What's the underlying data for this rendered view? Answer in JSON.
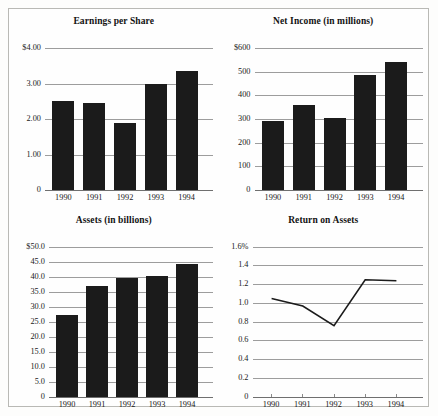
{
  "figure": {
    "background_color": "#fefefe",
    "border_color": "#b9b9b5",
    "bar_color": "#1b1b1b",
    "gridline_color": "#9d9d9d",
    "line_color": "#1b1b1b"
  },
  "charts": [
    {
      "id": "earnings-per-share",
      "chart_data": {
        "type": "bar",
        "title": "Earnings per Share",
        "categories": [
          "1990",
          "1991",
          "1992",
          "1993",
          "1994"
        ],
        "values": [
          2.5,
          2.45,
          1.88,
          2.98,
          3.35
        ],
        "ticks": [
          "$4.00",
          "3.00",
          "2.00",
          "1.00",
          "0"
        ],
        "tick_values": [
          4,
          3,
          2,
          1,
          0
        ],
        "ylim": [
          0,
          4
        ],
        "xlabel": "",
        "ylabel": "",
        "grid": true,
        "legend": "none"
      }
    },
    {
      "id": "net-income",
      "chart_data": {
        "type": "bar",
        "title": "Net Income (in millions)",
        "categories": [
          "1990",
          "1991",
          "1992",
          "1993",
          "1994"
        ],
        "values": [
          290,
          358,
          303,
          487,
          543
        ],
        "ticks": [
          "$600",
          "500",
          "400",
          "300",
          "200",
          "100",
          "0"
        ],
        "tick_values": [
          600,
          500,
          400,
          300,
          200,
          100,
          0
        ],
        "ylim": [
          0,
          600
        ],
        "xlabel": "",
        "ylabel": "",
        "grid": true,
        "legend": "none"
      }
    },
    {
      "id": "assets",
      "chart_data": {
        "type": "bar",
        "title": "Assets (in billions)",
        "categories": [
          "1990",
          "1991",
          "1992",
          "1993",
          "1994"
        ],
        "values": [
          27.2,
          37.0,
          39.5,
          40.2,
          44.2
        ],
        "ticks": [
          "$50.0",
          "45.0",
          "40.0",
          "35.0",
          "30.0",
          "25.0",
          "20.0",
          "15.0",
          "10.0",
          "5.0",
          "0"
        ],
        "tick_values": [
          50,
          45,
          40,
          35,
          30,
          25,
          20,
          15,
          10,
          5,
          0
        ],
        "ylim": [
          0,
          50
        ],
        "xlabel": "",
        "ylabel": "",
        "grid": true,
        "legend": "none"
      }
    },
    {
      "id": "return-on-assets",
      "chart_data": {
        "type": "line",
        "title": "Return on Assets",
        "categories": [
          "1990",
          "1991",
          "1992",
          "1993",
          "1994"
        ],
        "values": [
          1.05,
          0.97,
          0.76,
          1.25,
          1.24
        ],
        "ticks": [
          "1.6%",
          "1.4",
          "1.2",
          "1.0",
          "0.8",
          "0.6",
          "0.4",
          "0.2",
          "0"
        ],
        "tick_values": [
          1.6,
          1.4,
          1.2,
          1.0,
          0.8,
          0.6,
          0.4,
          0.2,
          0
        ],
        "ylim": [
          0,
          1.6
        ],
        "xlabel": "",
        "ylabel": "",
        "grid": true,
        "legend": "none"
      }
    }
  ]
}
